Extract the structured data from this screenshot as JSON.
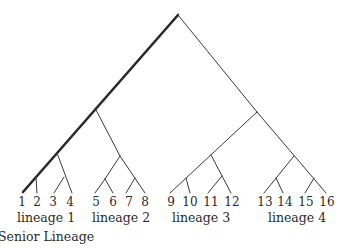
{
  "diagram": {
    "type": "phylogenetic-tree",
    "leaves": [
      "1",
      "2",
      "3",
      "4",
      "5",
      "6",
      "7",
      "8",
      "9",
      "10",
      "11",
      "12",
      "13",
      "14",
      "15",
      "16"
    ],
    "lineages": [
      {
        "label": "lineage 1",
        "leaves": [
          "1",
          "2",
          "3",
          "4"
        ],
        "note": "Senior Lineage"
      },
      {
        "label": "lineage 2",
        "leaves": [
          "5",
          "6",
          "7",
          "8"
        ]
      },
      {
        "label": "lineage 3",
        "leaves": [
          "9",
          "10",
          "11",
          "12"
        ]
      },
      {
        "label": "lineage 4",
        "leaves": [
          "13",
          "14",
          "15",
          "16"
        ]
      }
    ],
    "senior_lineage_label": "Senior Lineage",
    "highlight_path": "root-to-leaf-1 (thick line)",
    "colors": {
      "line": "#3a3a3a",
      "senior_line": "#2a2a2a",
      "text": "#2a2a2a",
      "background": "#ffffff"
    }
  }
}
